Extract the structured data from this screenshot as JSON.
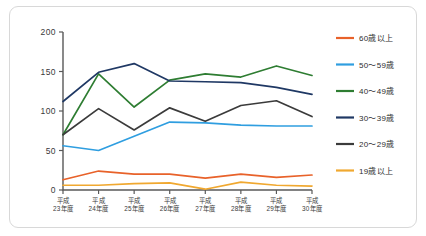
{
  "figure": {
    "background_color": "#ffffff",
    "border_color": "#d8d8d8"
  },
  "chart_data": {
    "type": "line",
    "title": "",
    "subtitle": "",
    "xlabel": "",
    "ylabel": "",
    "grid": false,
    "legend_position": "right",
    "ylim": [
      0,
      200
    ],
    "yticks": [
      0,
      50,
      100,
      150,
      200
    ],
    "ytick_labels": [
      "0",
      "50",
      "100",
      "150",
      "200"
    ],
    "categories": [
      "平成\n23年度",
      "平成\n24年度",
      "平成\n25年度",
      "平成\n26年度",
      "平成\n27年度",
      "平成\n28年度",
      "平成\n29年度",
      "平成\n30年度"
    ],
    "category_lines": [
      [
        "平成",
        "23年度"
      ],
      [
        "平成",
        "24年度"
      ],
      [
        "平成",
        "25年度"
      ],
      [
        "平成",
        "26年度"
      ],
      [
        "平成",
        "27年度"
      ],
      [
        "平成",
        "28年度"
      ],
      [
        "平成",
        "29年度"
      ],
      [
        "平成",
        "30年度"
      ]
    ],
    "series": [
      {
        "name": "60歳以上",
        "color": "#e8622a",
        "values": [
          13,
          24,
          20,
          20,
          15,
          20,
          16,
          19
        ]
      },
      {
        "name": "50〜59歳",
        "color": "#2f9ee0",
        "values": [
          56,
          50,
          68,
          86,
          85,
          82,
          81,
          81
        ]
      },
      {
        "name": "40〜49歳",
        "color": "#2e7d32",
        "values": [
          70,
          147,
          105,
          139,
          147,
          143,
          157,
          145
        ]
      },
      {
        "name": "30〜39歳",
        "color": "#1f3864",
        "values": [
          112,
          149,
          160,
          138,
          137,
          136,
          130,
          121
        ]
      },
      {
        "name": "20〜29歳",
        "color": "#3b3b3b",
        "values": [
          70,
          103,
          76,
          104,
          87,
          107,
          113,
          93
        ]
      },
      {
        "name": "19歳以上",
        "color": "#f0a830",
        "values": [
          6,
          6,
          8,
          9,
          1,
          10,
          6,
          5
        ]
      }
    ],
    "legend": [
      {
        "label": "60歳以上",
        "color": "#e8622a"
      },
      {
        "label": "50〜59歳",
        "color": "#2f9ee0"
      },
      {
        "label": "40〜49歳",
        "color": "#2e7d32"
      },
      {
        "label": "30〜39歳",
        "color": "#1f3864"
      },
      {
        "label": "20〜29歳",
        "color": "#3b3b3b"
      },
      {
        "label": "19歳以上",
        "color": "#f0a830"
      }
    ]
  }
}
